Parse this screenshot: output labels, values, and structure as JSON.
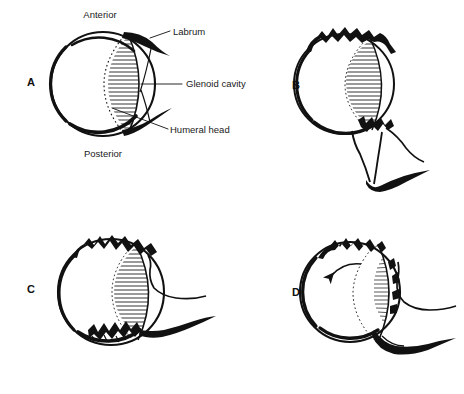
{
  "figure": {
    "kind": "medical-illustration",
    "canvas": {
      "width": 464,
      "height": 394,
      "background": "#ffffff"
    },
    "ink_color": "#111111",
    "panel_count": 4
  },
  "panels": [
    {
      "id": "A",
      "letter": "A",
      "letter_x": 31,
      "letter_y": 86,
      "caption": "",
      "center": {
        "x": 103,
        "y": 84
      },
      "radius": 52,
      "description": "Normal glenohumeral joint in cross-section: humeral head seated in glenoid cavity with intact anterior and posterior labrum",
      "has_arrow": false,
      "has_jagged_top": false,
      "has_bone_defect": false,
      "labels": [
        {
          "name": "anterior",
          "text": "Anterior",
          "x": 100,
          "y": 18,
          "anchor": "middle"
        },
        {
          "name": "posterior",
          "text": "Posterior",
          "x": 103,
          "y": 157,
          "anchor": "middle"
        },
        {
          "name": "labrum",
          "text": "Labrum",
          "x": 173,
          "y": 35,
          "anchor": "start"
        },
        {
          "name": "glenoid-cavity",
          "text": "Glenoid cavity",
          "x": 186,
          "y": 87,
          "anchor": "start"
        },
        {
          "name": "humeral-head",
          "text": "Humeral head",
          "x": 170,
          "y": 133,
          "anchor": "start"
        }
      ]
    },
    {
      "id": "B",
      "letter": "B",
      "letter_x": 296,
      "letter_y": 89,
      "caption": "",
      "center": {
        "x": 344,
        "y": 84
      },
      "radius": 50,
      "description": "Humeral head displaced with torn superior labrum and detached anteroinferior labrum at glenoid rim",
      "has_arrow": false,
      "has_jagged_top": true,
      "has_bone_defect": true,
      "labels": []
    },
    {
      "id": "C",
      "letter": "C",
      "letter_x": 31,
      "letter_y": 293,
      "caption": "",
      "center": {
        "x": 111,
        "y": 292
      },
      "radius": 53,
      "description": "Hatched glenoid cavity with jagged superior labral tear and inferior bony Bankart fragmentation",
      "has_arrow": false,
      "has_jagged_top": true,
      "has_bone_defect": true,
      "labels": []
    },
    {
      "id": "D",
      "letter": "D",
      "letter_x": 296,
      "letter_y": 296,
      "caption": "",
      "center": {
        "x": 350,
        "y": 292
      },
      "radius": 50,
      "description": "Humeral head rotating within disrupted glenoid, radial hatching with counter-clockwise rotation arrow",
      "has_arrow": true,
      "arrow_direction": "counter-clockwise",
      "has_jagged_top": true,
      "has_bone_defect": true,
      "labels": []
    }
  ],
  "legend_terms": [
    "Anterior",
    "Posterior",
    "Labrum",
    "Glenoid cavity",
    "Humeral head"
  ]
}
